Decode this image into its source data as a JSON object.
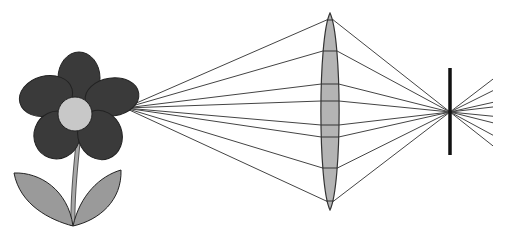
{
  "diagram": {
    "colors": {
      "background": "#ffffff",
      "petal": "#3a3a3a",
      "center": "#c8c8c8",
      "leaf": "#9a9a9a",
      "stem": "#a8a8a8",
      "outline": "#222222",
      "lens": "#b4b4b4",
      "ray": "#444444",
      "screen": "#111111"
    },
    "object": {
      "label": "flower",
      "center": [
        76,
        108
      ],
      "ray_origin": [
        125,
        108
      ]
    },
    "lens": {
      "label": "convex lens",
      "cx": 330,
      "top": 13,
      "bottom": 210,
      "half_width": 9
    },
    "screen": {
      "label": "screen",
      "x": 450,
      "top": 68,
      "bottom": 155
    },
    "focal_point": [
      450,
      112
    ],
    "rays_end_x": 493,
    "rays_lens_hits": [
      20,
      51,
      84,
      101,
      125,
      137,
      168,
      201
    ]
  }
}
